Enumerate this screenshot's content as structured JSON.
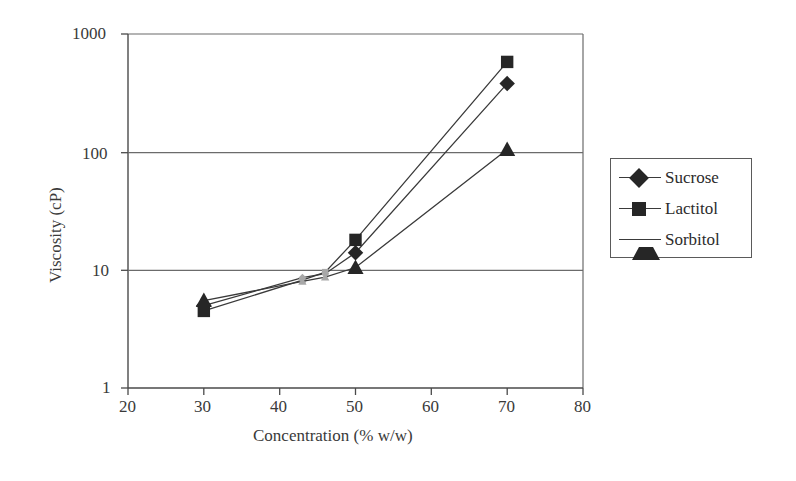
{
  "chart_data": {
    "type": "line",
    "title": "",
    "xlabel": "Concentration (% w/w)",
    "ylabel": "Viscosity (cP)",
    "xlim": [
      20,
      80
    ],
    "ylim": [
      1,
      1000
    ],
    "yscale": "log",
    "xscale": "linear",
    "xticks": [
      20,
      30,
      40,
      50,
      60,
      70,
      80
    ],
    "xtick_labels": [
      "20",
      "30",
      "40",
      "50",
      "60",
      "70",
      "80"
    ],
    "yticks": [
      1,
      10,
      100,
      1000
    ],
    "ytick_labels": [
      "1",
      "10",
      "100",
      "1000"
    ],
    "grid": "horizontal",
    "legend_position": "right-outside",
    "series": [
      {
        "name": "Sucrose",
        "marker": "diamond",
        "color": "#262626",
        "x": [
          30,
          43,
          46,
          50,
          70
        ],
        "y": [
          5.0,
          8.6,
          9.3,
          14.0,
          380
        ]
      },
      {
        "name": "Lactitol",
        "marker": "square",
        "color": "#262626",
        "x": [
          30,
          43,
          46,
          50,
          70
        ],
        "y": [
          4.5,
          8.2,
          9.6,
          18.0,
          580
        ]
      },
      {
        "name": "Sorbitol",
        "marker": "triangle",
        "color": "#262626",
        "x": [
          30,
          43,
          46,
          50,
          70
        ],
        "y": [
          5.5,
          8.0,
          8.7,
          10.5,
          105
        ]
      }
    ]
  },
  "legend": {
    "entries": [
      {
        "label": "Sucrose",
        "marker": "diamond-icon"
      },
      {
        "label": "Lactitol",
        "marker": "square-icon"
      },
      {
        "label": "Sorbitol",
        "marker": "triangle-icon"
      }
    ]
  },
  "axes": {
    "x_title": "Concentration (% w/w)",
    "y_title": "Viscosity (cP)",
    "x_ticks": [
      "20",
      "30",
      "40",
      "50",
      "60",
      "70",
      "80"
    ],
    "y_ticks": [
      "1000",
      "100",
      "10",
      "1"
    ]
  },
  "colors": {
    "marker": "#262626",
    "line": "#3a3a3a",
    "grid": "#6b6b6b",
    "axis": "#4a4a4a",
    "background": "#ffffff",
    "text": "#2b2b2b"
  }
}
